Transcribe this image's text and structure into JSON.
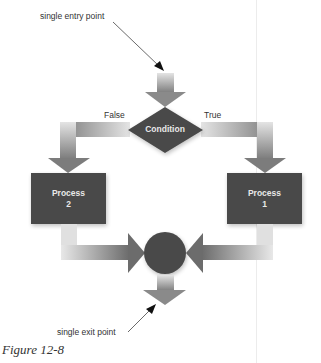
{
  "diagram": {
    "type": "flowchart",
    "annotations": {
      "entry": "single entry point",
      "exit": "single exit point"
    },
    "decision": {
      "label": "Condition",
      "branches": {
        "false_label": "False",
        "true_label": "True"
      }
    },
    "processes": [
      {
        "line1": "Process",
        "line2": "2",
        "branch": "False"
      },
      {
        "line1": "Process",
        "line2": "1",
        "branch": "True"
      }
    ],
    "junction": "merge-circle",
    "colors": {
      "shape_fill": "#4a4a4a",
      "arrow_light": "#e6e6e6",
      "arrow_dark": "#7a7a7a",
      "text_on_shape": "#e8e8e8",
      "label_text": "#333333"
    }
  },
  "caption": "Figure 12-8"
}
